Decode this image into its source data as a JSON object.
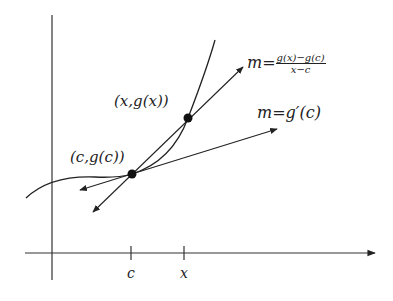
{
  "diagram": {
    "axes": {
      "x_axis": "horizontal axis with arrow",
      "y_axis": "vertical axis"
    },
    "ticks": [
      {
        "label": "c",
        "position": 131
      },
      {
        "label": "x",
        "position": 184
      }
    ],
    "points": [
      {
        "label": "(c,g(c))",
        "cx": 132,
        "cy": 174
      },
      {
        "label": "(x,g(x))",
        "cx": 188,
        "cy": 118
      }
    ],
    "secant_label": {
      "lhs": "m=",
      "numerator": "g(x)−g(c)",
      "denominator": "x−c"
    },
    "tangent_label": "m=g′(c)",
    "colors": {
      "line": "#222222",
      "point": "#111111",
      "background": "#ffffff"
    }
  }
}
